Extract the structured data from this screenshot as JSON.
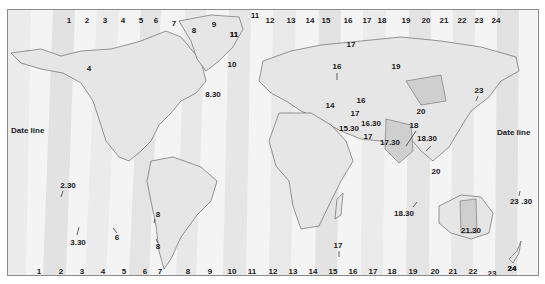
{
  "map": {
    "date_line_left": "Date line",
    "date_line_right": "Date line",
    "top_zone_numbers": [
      "1",
      "2",
      "3",
      "4",
      "5",
      "6",
      "7",
      "8",
      "9",
      "11",
      "11",
      "12",
      "13",
      "14",
      "15",
      "16",
      "17",
      "18",
      "19",
      "20",
      "21",
      "22",
      "23",
      "24"
    ],
    "bottom_zone_numbers": [
      "1",
      "2",
      "3",
      "4",
      "5",
      "6",
      "7",
      "8",
      "9",
      "10",
      "11",
      "12",
      "13",
      "14",
      "15",
      "16",
      "17",
      "18",
      "19",
      "20",
      "21",
      "22",
      "23",
      "24"
    ],
    "region_labels": [
      {
        "text": "4",
        "x": 88,
        "y": 68
      },
      {
        "text": "8.30",
        "x": 207,
        "y": 95
      },
      {
        "text": "10",
        "x": 231,
        "y": 64
      },
      {
        "text": "11",
        "x": 233,
        "y": 34
      },
      {
        "text": "17",
        "x": 350,
        "y": 44
      },
      {
        "text": "16",
        "x": 336,
        "y": 66
      },
      {
        "text": "19",
        "x": 395,
        "y": 66
      },
      {
        "text": "23",
        "x": 478,
        "y": 90
      },
      {
        "text": "16",
        "x": 360,
        "y": 100
      },
      {
        "text": "14",
        "x": 329,
        "y": 105
      },
      {
        "text": "17",
        "x": 354,
        "y": 113
      },
      {
        "text": "20",
        "x": 420,
        "y": 111
      },
      {
        "text": "16.30",
        "x": 370,
        "y": 123
      },
      {
        "text": "15.30",
        "x": 348,
        "y": 128
      },
      {
        "text": "18",
        "x": 413,
        "y": 125
      },
      {
        "text": "17",
        "x": 367,
        "y": 136
      },
      {
        "text": "17.30",
        "x": 389,
        "y": 142
      },
      {
        "text": "18.30",
        "x": 426,
        "y": 138
      },
      {
        "text": "20",
        "x": 435,
        "y": 171
      },
      {
        "text": "2.30",
        "x": 67,
        "y": 185
      },
      {
        "text": "8",
        "x": 157,
        "y": 214
      },
      {
        "text": "6",
        "x": 116,
        "y": 237
      },
      {
        "text": "3.30",
        "x": 77,
        "y": 242
      },
      {
        "text": "8",
        "x": 157,
        "y": 246
      },
      {
        "text": "18.30",
        "x": 403,
        "y": 213
      },
      {
        "text": "23 .30",
        "x": 520,
        "y": 201
      },
      {
        "text": "21.30",
        "x": 470,
        "y": 230
      },
      {
        "text": "17",
        "x": 337,
        "y": 245
      },
      {
        "text": "24",
        "x": 511,
        "y": 268
      }
    ],
    "colors": {
      "background": "#f4f4f4",
      "zone_dark": "#dcdcdc",
      "zone_light": "#ffffff",
      "land": "#e6e6e6",
      "land_dark": "#c8c8c8",
      "coastline": "#555555",
      "text": "#1a1a1a",
      "border": "#8a8a8a"
    }
  }
}
